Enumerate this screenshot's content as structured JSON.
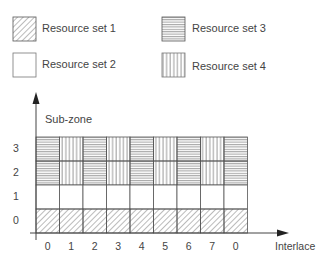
{
  "legend": [
    {
      "pattern": "diagonal",
      "label": "Resource set 1"
    },
    {
      "pattern": "blank",
      "label": "Resource set 2"
    },
    {
      "pattern": "horizontal",
      "label": "Resource set 3"
    },
    {
      "pattern": "vertical",
      "label": "Resource set 4"
    }
  ],
  "axes": {
    "y_label": "Sub-zone",
    "x_label": "Interlace",
    "y_ticks": [
      "3",
      "2",
      "1",
      "0"
    ],
    "x_ticks": [
      "0",
      "1",
      "2",
      "3",
      "4",
      "5",
      "6",
      "7",
      "0"
    ]
  },
  "grid": {
    "rows": [
      {
        "subzone": "3",
        "cells": [
          "horizontal",
          "vertical",
          "horizontal",
          "vertical",
          "horizontal",
          "vertical",
          "horizontal",
          "vertical",
          "horizontal"
        ]
      },
      {
        "subzone": "2",
        "cells": [
          "horizontal",
          "vertical",
          "horizontal",
          "vertical",
          "horizontal",
          "vertical",
          "horizontal",
          "vertical",
          "horizontal"
        ]
      },
      {
        "subzone": "1",
        "cells": [
          "blank",
          "blank",
          "blank",
          "blank",
          "blank",
          "blank",
          "blank",
          "blank",
          "blank"
        ]
      },
      {
        "subzone": "0",
        "cells": [
          "diagonal",
          "diagonal",
          "diagonal",
          "diagonal",
          "diagonal",
          "diagonal",
          "diagonal",
          "diagonal",
          "diagonal"
        ]
      }
    ]
  }
}
